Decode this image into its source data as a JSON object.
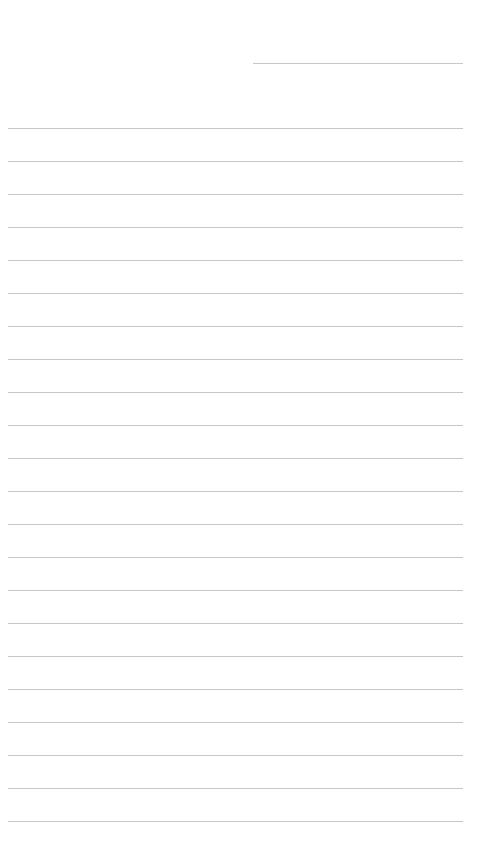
{
  "page": {
    "type": "lined-paper",
    "background_color": "#ffffff",
    "line_color": "#c6c6c6",
    "header_line": {
      "present": true
    },
    "ruled_lines": {
      "count": 22,
      "first_y": 128,
      "spacing": 33
    },
    "text_content": []
  }
}
